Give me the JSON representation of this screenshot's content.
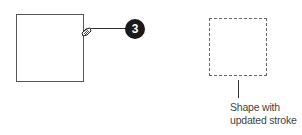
{
  "diagram": {
    "left_shape": {
      "type": "square",
      "stroke": "solid",
      "stroke_color": "#555555"
    },
    "cursor": {
      "icon": "brush-cursor-icon"
    },
    "callout": {
      "number": "3",
      "badge_color": "#1a1a1a",
      "text_color": "#ffffff"
    },
    "right_shape": {
      "type": "square",
      "stroke": "dashed",
      "stroke_color": "#666666"
    },
    "caption": {
      "line1": "Shape with",
      "line2": "updated stroke"
    }
  }
}
